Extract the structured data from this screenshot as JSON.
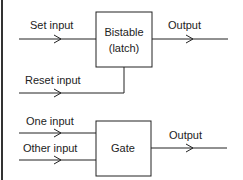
{
  "diagram": {
    "bistable": {
      "box_label_line1": "Bistable",
      "box_label_line2": "(latch)",
      "set_input": "Set input",
      "reset_input": "Reset input",
      "output": "Output"
    },
    "gate": {
      "box_label": "Gate",
      "one_input": "One input",
      "other_input": "Other input",
      "output": "Output"
    },
    "colors": {
      "line": "#222222",
      "background": "#ffffff"
    }
  }
}
